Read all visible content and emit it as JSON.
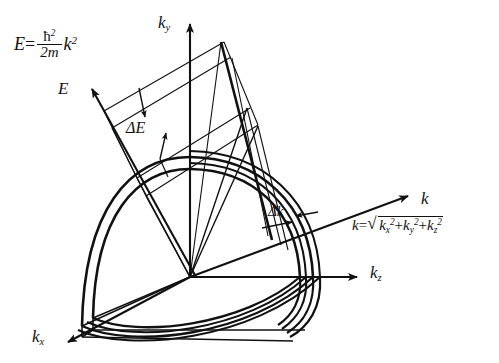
{
  "figure": {
    "background_color": "#ffffff",
    "line_color": "#111111"
  },
  "formula": {
    "lhs": "E",
    "equals": "=",
    "hbar": "ħ",
    "hbar_exp": "2",
    "denominator": "2m",
    "k": "k",
    "k_exp": "2",
    "plain": "E = ħ² / 2m k²"
  },
  "k_equation": {
    "k": "k",
    "equals": "=",
    "radical": "√",
    "term1": "k",
    "term1_sub": "x",
    "term1_exp": "2",
    "plus1": "+",
    "term2": "k",
    "term2_sub": "y",
    "term2_exp": "2",
    "plus2": "+",
    "term3": "k",
    "term3_sub": "z",
    "term3_exp": "2",
    "plain": "k = √(kx² + ky² + kz²)"
  },
  "axes": [
    {
      "id": "ky",
      "label": "k",
      "sub": "y",
      "direction": "up",
      "tip": [
        190,
        18
      ]
    },
    {
      "id": "kz",
      "label": "k",
      "sub": "z",
      "direction": "right",
      "tip": [
        363,
        277
      ]
    },
    {
      "id": "kx",
      "label": "k",
      "sub": "x",
      "direction": "down-left",
      "tip": [
        63,
        345
      ]
    },
    {
      "id": "E",
      "label": "E",
      "sub": "",
      "direction": "up-left",
      "tip": [
        86,
        84
      ]
    },
    {
      "id": "k",
      "label": "k",
      "sub": "",
      "direction": "up-right",
      "tip": [
        414,
        193
      ]
    }
  ],
  "annotations": [
    {
      "id": "delta-E",
      "label": "ΔE",
      "meaning": "energy shell thickness"
    },
    {
      "id": "delta-k",
      "label": "Δk",
      "meaning": "wavevector shell thickness"
    }
  ],
  "shell": {
    "description": "two nested spherical octant surfaces separated by Δk",
    "inner_radius_px": 100,
    "outer_radius_px": 112
  }
}
